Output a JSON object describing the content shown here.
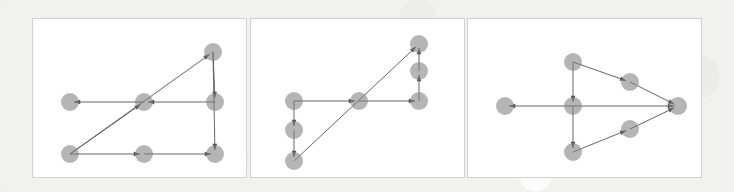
{
  "figure": {
    "canvas": {
      "width": 734,
      "height": 192
    },
    "background_color": "#f1f1ef",
    "panel_background": "#ffffff",
    "panel_border_color": "#d2d2d2",
    "node_color": "#808080",
    "node_opacity": 0.58,
    "node_radius": 9,
    "edge_color": "#555555",
    "edge_width": 0.9,
    "panel_count": 3
  },
  "panels": [
    {
      "name": "panel-1",
      "label": "",
      "rect": {
        "x": 32,
        "y": 18,
        "width": 215,
        "height": 160
      },
      "node_count": 7,
      "edge_count": 8,
      "nodes": [
        {
          "id": "n0",
          "x": 37,
          "y": 83
        },
        {
          "id": "n1",
          "x": 111,
          "y": 83
        },
        {
          "id": "n2",
          "x": 182,
          "y": 83
        },
        {
          "id": "n3",
          "x": 37,
          "y": 135
        },
        {
          "id": "n4",
          "x": 111,
          "y": 135
        },
        {
          "id": "n5",
          "x": 182,
          "y": 135
        },
        {
          "id": "n6",
          "x": 180,
          "y": 33
        }
      ],
      "edges": [
        {
          "from": "n1",
          "to": "n0",
          "arrow": true
        },
        {
          "from": "n2",
          "to": "n1",
          "arrow": true
        },
        {
          "from": "n6",
          "to": "n5",
          "arrow": true
        },
        {
          "from": "n6",
          "to": "n2",
          "arrow": true
        },
        {
          "from": "n3",
          "to": "n6",
          "arrow": true
        },
        {
          "from": "n3",
          "to": "n4",
          "arrow": true
        },
        {
          "from": "n4",
          "to": "n5",
          "arrow": true
        },
        {
          "from": "n3",
          "to": "n1",
          "arrow": true
        }
      ]
    },
    {
      "name": "panel-2",
      "label": "",
      "rect": {
        "x": 250,
        "y": 18,
        "width": 215,
        "height": 160
      },
      "node_count": 7,
      "edge_count": 7,
      "nodes": [
        {
          "id": "m0",
          "x": 43,
          "y": 82
        },
        {
          "id": "m1",
          "x": 43,
          "y": 111
        },
        {
          "id": "m2",
          "x": 43,
          "y": 142
        },
        {
          "id": "m3",
          "x": 108,
          "y": 82
        },
        {
          "id": "m4",
          "x": 168,
          "y": 82
        },
        {
          "id": "m5",
          "x": 168,
          "y": 52
        },
        {
          "id": "m6",
          "x": 168,
          "y": 25
        }
      ],
      "edges": [
        {
          "from": "m0",
          "to": "m1",
          "arrow": true
        },
        {
          "from": "m1",
          "to": "m2",
          "arrow": true
        },
        {
          "from": "m0",
          "to": "m3",
          "arrow": true
        },
        {
          "from": "m3",
          "to": "m4",
          "arrow": true
        },
        {
          "from": "m4",
          "to": "m5",
          "arrow": true
        },
        {
          "from": "m5",
          "to": "m6",
          "arrow": true
        },
        {
          "from": "m2",
          "to": "m6",
          "arrow": true
        }
      ]
    },
    {
      "name": "panel-3",
      "label": "",
      "rect": {
        "x": 467,
        "y": 18,
        "width": 235,
        "height": 160
      },
      "node_count": 7,
      "edge_count": 7,
      "nodes": [
        {
          "id": "p0",
          "x": 37,
          "y": 87
        },
        {
          "id": "p1",
          "x": 105,
          "y": 87
        },
        {
          "id": "p2",
          "x": 105,
          "y": 43
        },
        {
          "id": "p3",
          "x": 105,
          "y": 133
        },
        {
          "id": "p4",
          "x": 162,
          "y": 63
        },
        {
          "id": "p5",
          "x": 162,
          "y": 110
        },
        {
          "id": "p6",
          "x": 210,
          "y": 87
        }
      ],
      "edges": [
        {
          "from": "p1",
          "to": "p0",
          "arrow": true
        },
        {
          "from": "p2",
          "to": "p1",
          "arrow": true
        },
        {
          "from": "p1",
          "to": "p3",
          "arrow": true
        },
        {
          "from": "p2",
          "to": "p4",
          "arrow": true
        },
        {
          "from": "p4",
          "to": "p6",
          "arrow": true
        },
        {
          "from": "p3",
          "to": "p5",
          "arrow": true
        },
        {
          "from": "p5",
          "to": "p6",
          "arrow": true
        },
        {
          "from": "p1",
          "to": "p6",
          "arrow": true
        }
      ]
    }
  ]
}
